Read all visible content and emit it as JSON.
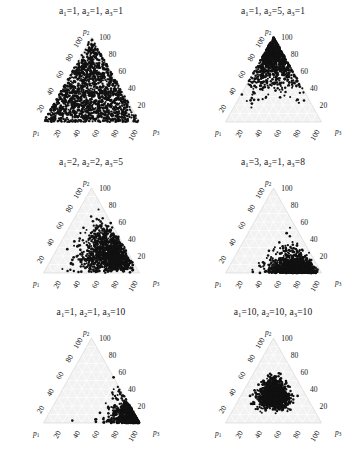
{
  "figure": {
    "type": "scatter-matrix",
    "panel_count": 6,
    "rows": 3,
    "cols": 2,
    "background_color": "#ffffff",
    "point_color": "#111111",
    "triangle_fill_color": "#f2f2f2",
    "grid_color": "#ffffff"
  },
  "axes": {
    "vertex_top": "p2",
    "vertex_left": "p1",
    "vertex_right": "p3",
    "tick_values": [
      20,
      40,
      60,
      80,
      100
    ],
    "left_ticks": [
      "20",
      "40",
      "60",
      "80",
      "100"
    ],
    "right_ticks": [
      "20",
      "40",
      "60",
      "80",
      "100"
    ],
    "bottom_ticks": [
      "20",
      "40",
      "60",
      "80",
      "100"
    ],
    "grid_step": 10,
    "axis_max": 100
  },
  "panels": [
    {
      "id": "panel-1",
      "title": "a1=1, a2=1, a3=1",
      "a1": 1,
      "a2": 1,
      "a3": 1,
      "pattern": "uniform",
      "n_points": 1400,
      "description": "points fill the whole simplex uniformly"
    },
    {
      "id": "panel-2",
      "title": "a1=1, a2=5, a3=1",
      "a1": 1,
      "a2": 5,
      "a3": 1,
      "pattern": "top-apex",
      "n_points": 900,
      "description": "points concentrate toward the p2 apex"
    },
    {
      "id": "panel-3",
      "title": "a1=2, a2=2, a3=5",
      "a1": 2,
      "a2": 2,
      "a3": 5,
      "pattern": "right-lean",
      "n_points": 1100,
      "description": "points lean toward the p3 side, broad spread"
    },
    {
      "id": "panel-4",
      "title": "a1=3, a2=1, a3=8",
      "a1": 3,
      "a2": 1,
      "a3": 8,
      "pattern": "bottom-right",
      "n_points": 1000,
      "description": "points hug the bottom edge near p3"
    },
    {
      "id": "panel-5",
      "title": "a1=1, a2=1, a3=10",
      "a1": 1,
      "a2": 1,
      "a3": 10,
      "pattern": "right-corner",
      "n_points": 800,
      "description": "points tightly packed in the p3 corner"
    },
    {
      "id": "panel-6",
      "title": "a1=10, a2=10, a3=10",
      "a1": 10,
      "a2": 10,
      "a3": 10,
      "pattern": "center",
      "n_points": 1200,
      "description": "points cluster tightly at the centroid"
    }
  ],
  "chart_data": {
    "type": "scatter",
    "title": "",
    "xlabel": "",
    "ylabel": "",
    "coordinate_system": "ternary-simplex",
    "components": [
      "p1",
      "p2",
      "p3"
    ],
    "axis_range": [
      0,
      100
    ],
    "grid": true,
    "legend": "none",
    "series": [
      {
        "name": "a1=1, a2=1, a3=1",
        "dirichlet_alpha": [
          1,
          1,
          1
        ],
        "mean": [
          33.3,
          33.3,
          33.3
        ],
        "n": 1400
      },
      {
        "name": "a1=1, a2=5, a3=1",
        "dirichlet_alpha": [
          1,
          5,
          1
        ],
        "mean": [
          14.3,
          71.4,
          14.3
        ],
        "n": 900
      },
      {
        "name": "a1=2, a2=2, a3=5",
        "dirichlet_alpha": [
          2,
          2,
          5
        ],
        "mean": [
          22.2,
          22.2,
          55.6
        ],
        "n": 1100
      },
      {
        "name": "a1=3, a2=1, a3=8",
        "dirichlet_alpha": [
          3,
          1,
          8
        ],
        "mean": [
          25.0,
          8.3,
          66.7
        ],
        "n": 1000
      },
      {
        "name": "a1=1, a2=1, a3=10",
        "dirichlet_alpha": [
          1,
          1,
          10
        ],
        "mean": [
          8.3,
          8.3,
          83.3
        ],
        "n": 800
      },
      {
        "name": "a1=10, a2=10, a3=10",
        "dirichlet_alpha": [
          10,
          10,
          10
        ],
        "mean": [
          33.3,
          33.3,
          33.3
        ],
        "n": 1200
      }
    ]
  }
}
